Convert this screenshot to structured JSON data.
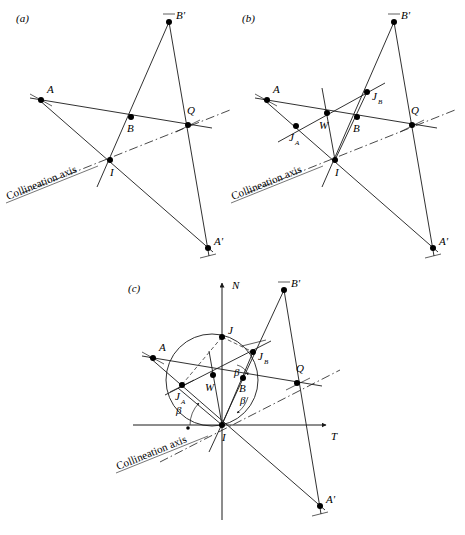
{
  "figure": {
    "type": "geometric-construction-diagram",
    "panel_count": 3,
    "stroke_color": "#1a1a1a",
    "point_color": "#000000",
    "background": "#ffffff",
    "axis_line_style": "dash-dot",
    "common_labels": {
      "collineation_axis": "Collineation axis",
      "A": "A",
      "A_prime": "A'",
      "B": "B",
      "B_prime": "B'",
      "I": "I",
      "Q": "Q",
      "W": "W",
      "J": "J",
      "J_A": "J",
      "J_A_sub": "A",
      "J_B": "J",
      "J_B_sub": "B",
      "beta": "β",
      "axis_N": "N",
      "axis_T": "T"
    },
    "panels": [
      {
        "id": "a",
        "label": "(a)",
        "label_pos": [
          16,
          18
        ],
        "caption": "Collineation axis",
        "points": [
          {
            "name": "A",
            "label": "A",
            "x": 41,
            "y": 100,
            "lx": 47,
            "ly": 93
          },
          {
            "name": "B",
            "label": "B",
            "x": 131,
            "y": 117,
            "lx": 129,
            "ly": 130
          },
          {
            "name": "Bp",
            "label": "B'",
            "x": 169,
            "y": 22,
            "lx": 176,
            "ly": 17
          },
          {
            "name": "Q",
            "label": "Q",
            "x": 188,
            "y": 125,
            "lx": 190,
            "ly": 114
          },
          {
            "name": "I",
            "label": "I",
            "x": 110,
            "y": 160,
            "lx": 112,
            "ly": 175
          },
          {
            "name": "Ap",
            "label": "A'",
            "x": 208,
            "y": 248,
            "lx": 214,
            "ly": 243
          }
        ],
        "segments": [
          [
            "A",
            "Q"
          ],
          [
            "A",
            "Ap"
          ],
          [
            "I",
            "Bp"
          ],
          [
            "Bp",
            "Ap"
          ]
        ],
        "axis_label_pos": [
          10,
          196
        ],
        "axis_label_rotation": -22
      },
      {
        "id": "b",
        "label": "(b)",
        "label_pos": [
          242,
          18
        ],
        "caption": "Collineation axis",
        "points": [
          {
            "name": "A",
            "label": "A",
            "x": 267,
            "y": 100,
            "lx": 273,
            "ly": 93
          },
          {
            "name": "JA",
            "label": "J",
            "sub": "A",
            "x": 296,
            "y": 126,
            "lx": 291,
            "ly": 140
          },
          {
            "name": "W",
            "label": "W",
            "x": 327,
            "y": 113,
            "lx": 322,
            "ly": 127
          },
          {
            "name": "B",
            "label": "B",
            "x": 357,
            "y": 117,
            "lx": 355,
            "ly": 130
          },
          {
            "name": "JB",
            "label": "J",
            "sub": "B",
            "x": 367,
            "y": 92,
            "lx": 372,
            "ly": 99
          },
          {
            "name": "Bp",
            "label": "B'",
            "x": 394,
            "y": 22,
            "lx": 401,
            "ly": 17
          },
          {
            "name": "Q",
            "label": "Q",
            "x": 412,
            "y": 125,
            "lx": 414,
            "ly": 114
          },
          {
            "name": "I",
            "label": "I",
            "x": 335,
            "y": 160,
            "lx": 337,
            "ly": 175
          },
          {
            "name": "Ap",
            "label": "A'",
            "x": 433,
            "y": 248,
            "lx": 439,
            "ly": 243
          }
        ],
        "segments": [
          [
            "A",
            "Q"
          ],
          [
            "A",
            "Ap"
          ],
          [
            "I",
            "Bp"
          ],
          [
            "Bp",
            "Ap"
          ],
          [
            "JA",
            "JB"
          ],
          [
            "I",
            "W"
          ]
        ],
        "axis_label_pos": [
          235,
          196
        ],
        "axis_label_rotation": -22
      },
      {
        "id": "c",
        "label": "(c)",
        "label_pos": [
          128,
          288
        ],
        "caption": "Collineation axis",
        "axis_N_label": "N",
        "axis_T_label": "T",
        "origin": [
          222,
          425
        ],
        "circle": {
          "cx": 212,
          "cy": 380,
          "r": 46
        },
        "points": [
          {
            "name": "A",
            "label": "A",
            "x": 153,
            "y": 358,
            "lx": 159,
            "ly": 351
          },
          {
            "name": "JA",
            "label": "J",
            "sub": "A",
            "x": 182,
            "y": 385,
            "lx": 177,
            "ly": 398
          },
          {
            "name": "W",
            "label": "W",
            "x": 213,
            "y": 375,
            "lx": 208,
            "ly": 388
          },
          {
            "name": "J",
            "label": "J",
            "x": 222,
            "y": 337,
            "lx": 228,
            "ly": 332
          },
          {
            "name": "B",
            "label": "B",
            "x": 243,
            "y": 378,
            "lx": 241,
            "ly": 391
          },
          {
            "name": "JB",
            "label": "J",
            "sub": "B",
            "x": 253,
            "y": 352,
            "lx": 258,
            "ly": 359
          },
          {
            "name": "Bp",
            "label": "B'",
            "x": 284,
            "y": 290,
            "lx": 291,
            "ly": 285
          },
          {
            "name": "Q",
            "label": "Q",
            "x": 297,
            "y": 383,
            "lx": 299,
            "ly": 372
          },
          {
            "name": "I",
            "label": "I",
            "x": 222,
            "y": 425,
            "lx": 224,
            "ly": 440
          },
          {
            "name": "Ap",
            "label": "A'",
            "x": 320,
            "y": 506,
            "lx": 326,
            "ly": 501
          }
        ],
        "segments": [
          [
            "A",
            "Q"
          ],
          [
            "A",
            "Ap"
          ],
          [
            "I",
            "Bp"
          ],
          [
            "Bp",
            "Ap"
          ],
          [
            "JA",
            "JB"
          ],
          [
            "I",
            "W"
          ],
          [
            "I",
            "J"
          ],
          [
            "J",
            "JA"
          ],
          [
            "J",
            "JB"
          ]
        ],
        "beta_labels": [
          {
            "text": "β",
            "x": 180,
            "y": 410
          },
          {
            "text": "β",
            "x": 238,
            "y": 372
          },
          {
            "text": "β",
            "x": 243,
            "y": 400
          }
        ],
        "axis_label_pos": [
          120,
          465
        ],
        "axis_label_rotation": -22
      }
    ]
  }
}
